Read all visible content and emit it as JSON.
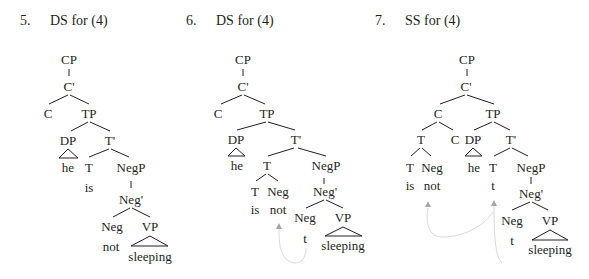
{
  "figures": [
    {
      "number": "5.",
      "title": "DS for (4)",
      "nodes": {
        "cp": "CP",
        "cbar": "C'",
        "c": "C",
        "tp": "TP",
        "dp": "DP",
        "he": "he",
        "tbar": "T'",
        "t": "T",
        "is": "is",
        "negp": "NegP",
        "negbar": "Neg'",
        "neg": "Neg",
        "not": "not",
        "vp": "VP",
        "sleeping": "sleeping"
      }
    },
    {
      "number": "6.",
      "title": "DS for (4)",
      "nodes": {
        "cp": "CP",
        "cbar": "C'",
        "c": "C",
        "tp": "TP",
        "dp": "DP",
        "he": "he",
        "tbar": "T'",
        "t_top": "T",
        "t": "T",
        "is": "is",
        "neg_adj": "Neg",
        "not": "not",
        "negp": "NegP",
        "negbar": "Neg'",
        "neg": "Neg",
        "trace": "t",
        "vp": "VP",
        "sleeping": "sleeping"
      },
      "movement": "Neg head moves from NegP to adjoin to T"
    },
    {
      "number": "7.",
      "title": "SS for (4)",
      "nodes": {
        "cp": "CP",
        "cbar": "C'",
        "c_top": "C",
        "t_top": "T",
        "t": "T",
        "is": "is",
        "neg_adj": "Neg",
        "not": "not",
        "c": "C",
        "tp": "TP",
        "dp": "DP",
        "he": "he",
        "tbar": "T'",
        "t_trace_node": "T",
        "t_trace": "t",
        "negp": "NegP",
        "negbar": "Neg'",
        "neg": "Neg",
        "neg_trace": "t",
        "vp": "VP",
        "sleeping": "sleeping"
      },
      "movement": "T+Neg complex moves to C; Neg moves to T"
    }
  ]
}
